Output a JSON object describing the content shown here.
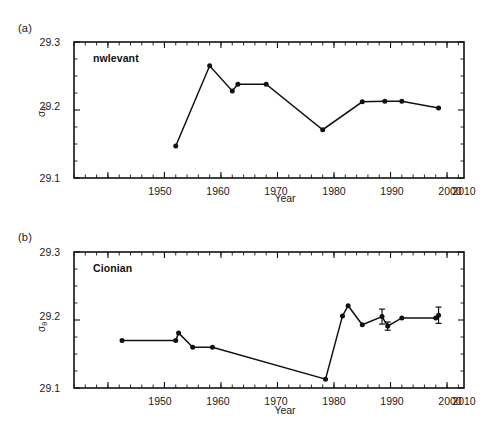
{
  "figure": {
    "panels": [
      {
        "tag": "(a)",
        "series_label": "nwlevant",
        "xlabel": "Year",
        "ylabel_sigma": "σ",
        "ylabel_sub": "θ",
        "ytick_labels": [
          "29.3",
          "29.2",
          "29.1"
        ],
        "xtick_labels": [
          "1950",
          "1960",
          "1970",
          "1980",
          "1990",
          "2000",
          "2010"
        ]
      },
      {
        "tag": "(b)",
        "series_label": "Cionian",
        "xlabel": "Year",
        "ylabel_sigma": "σ",
        "ylabel_sub": "θ",
        "ytick_labels": [
          "29.3",
          "29.2",
          "29.1"
        ],
        "xtick_labels": [
          "1950",
          "1960",
          "1970",
          "1980",
          "1990",
          "2000",
          "2010"
        ]
      }
    ]
  },
  "chart_data": [
    {
      "type": "line",
      "title": "(a) nwlevant",
      "series_name": "nwlevant",
      "xlabel": "Year",
      "ylabel": "sigma-theta",
      "xlim": [
        1944,
        2013
      ],
      "ylim": [
        29.1,
        29.3
      ],
      "ytick_values": [
        29.1,
        29.2,
        29.3
      ],
      "xtick_values": [
        1950,
        1960,
        1970,
        1980,
        1990,
        2000,
        2010
      ],
      "minor_tick_interval": 2,
      "grid": false,
      "legend": "none",
      "marker": "filled-circle",
      "x": [
        1962,
        1968,
        1972,
        1973,
        1978,
        1988,
        1995,
        1999,
        2002,
        2008.5
      ],
      "y": [
        29.147,
        29.265,
        29.228,
        29.238,
        29.238,
        29.171,
        29.212,
        29.213,
        29.213,
        29.203
      ],
      "errors": []
    },
    {
      "type": "line",
      "title": "(b) Cionian",
      "series_name": "Cionian",
      "xlabel": "Year",
      "ylabel": "sigma-theta",
      "xlim": [
        1944,
        2013
      ],
      "ylim": [
        29.1,
        29.3
      ],
      "ytick_values": [
        29.1,
        29.2,
        29.3
      ],
      "xtick_values": [
        1950,
        1960,
        1970,
        1980,
        1990,
        2000,
        2010
      ],
      "minor_tick_interval": 2,
      "grid": false,
      "legend": "none",
      "marker": "filled-circle",
      "x": [
        1952.5,
        1962,
        1962.5,
        1965,
        1968.5,
        1988.5,
        1991.5,
        1992.5,
        1995,
        1998.5,
        1999.5,
        2002,
        2008,
        2008.5
      ],
      "y": [
        29.17,
        29.17,
        29.181,
        29.16,
        29.16,
        29.113,
        29.206,
        29.221,
        29.193,
        29.205,
        29.191,
        29.203,
        29.203,
        29.207
      ],
      "errors": [
        {
          "x": 1998.5,
          "y": 29.205,
          "err": 0.011
        },
        {
          "x": 1999.5,
          "y": 29.191,
          "err": 0.006
        },
        {
          "x": 2008.5,
          "y": 29.207,
          "err": 0.012
        }
      ]
    }
  ]
}
